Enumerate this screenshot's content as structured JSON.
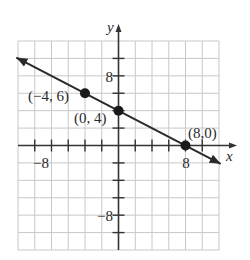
{
  "chart_data": {
    "type": "line",
    "title": "",
    "xlabel": "x",
    "ylabel": "y",
    "xlim": [
      -12,
      12
    ],
    "ylim": [
      -12,
      12
    ],
    "grid": true,
    "grid_step": 2,
    "x_tick_labels": [
      {
        "value": -8,
        "text": "−8"
      },
      {
        "value": 8,
        "text": "8"
      }
    ],
    "y_tick_labels": [
      {
        "value": 8,
        "text": "8"
      },
      {
        "value": -8,
        "text": "−8"
      }
    ],
    "series": [
      {
        "name": "line",
        "equation": "y = -x/2 + 4",
        "arrows": "both",
        "x": [
          -4,
          0,
          8
        ],
        "y": [
          6,
          4,
          0
        ]
      }
    ],
    "points": [
      {
        "x": -4,
        "y": 6,
        "label": "(−4, 6)"
      },
      {
        "x": 0,
        "y": 4,
        "label": "(0, 4)"
      },
      {
        "x": 8,
        "y": 0,
        "label": "(8,0)"
      }
    ]
  },
  "colors": {
    "grid": "#c8c8c8",
    "axis": "#333333",
    "line": "#2a2a2a",
    "point": "#1a1a1a"
  }
}
